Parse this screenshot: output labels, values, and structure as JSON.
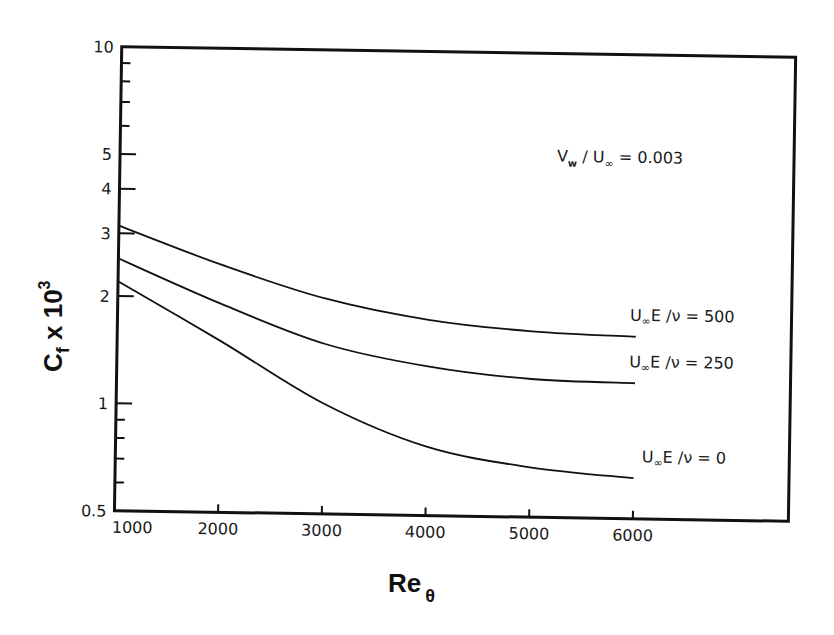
{
  "chart_data": {
    "type": "line",
    "title": "",
    "xlabel": "Re θ",
    "xlabel_main": "Re",
    "xlabel_sub": "θ",
    "ylabel": "C_f x 10^3",
    "ylabel_main": "C",
    "ylabel_sub": "f",
    "ylabel_mid": " x 10",
    "ylabel_sup": "3",
    "xscale": "linear",
    "yscale": "log",
    "xlim": [
      1000,
      7500
    ],
    "ylim": [
      0.5,
      10
    ],
    "grid": false,
    "x_ticks": [
      1000,
      2000,
      3000,
      4000,
      5000,
      6000
    ],
    "x_tick_labels": [
      "1000",
      "2000",
      "3000",
      "4000",
      "5000",
      "6000"
    ],
    "y_ticks": [
      0.5,
      0.6,
      0.7,
      0.8,
      0.9,
      1,
      2,
      3,
      4,
      5,
      6,
      7,
      8,
      9,
      10
    ],
    "y_tick_labels": [
      {
        "value": 0.5,
        "label": "0.5"
      },
      {
        "value": 1,
        "label": "1"
      },
      {
        "value": 2,
        "label": "2"
      },
      {
        "value": 3,
        "label": "3"
      },
      {
        "value": 4,
        "label": "4"
      },
      {
        "value": 5,
        "label": "5"
      },
      {
        "value": 10,
        "label": "10"
      }
    ],
    "x": [
      1000,
      2000,
      3000,
      4000,
      5000,
      6000
    ],
    "series": [
      {
        "name": "U∞E/ν = 500",
        "label_main": "U",
        "label_sub": "∞",
        "label_rest": "E /ν = 500",
        "values": [
          3.15,
          2.47,
          2.01,
          1.77,
          1.66,
          1.62
        ]
      },
      {
        "name": "U∞E/ν = 250",
        "label_main": "U",
        "label_sub": "∞",
        "label_rest": "E /ν = 250",
        "values": [
          2.55,
          1.92,
          1.5,
          1.31,
          1.22,
          1.2
        ]
      },
      {
        "name": "U∞E/ν = 0",
        "label_main": "U",
        "label_sub": "∞",
        "label_rest": "E /ν =  0",
        "values": [
          2.2,
          1.51,
          1.02,
          0.78,
          0.69,
          0.65
        ]
      }
    ],
    "annotations": [
      {
        "text": "V_w / U∞ = 0.003",
        "main": "V",
        "sub": "w",
        "rest1": " / U",
        "sub2": "∞",
        "rest2": " =  0.003"
      }
    ],
    "legend_position": "inline labels at right end of curves"
  }
}
